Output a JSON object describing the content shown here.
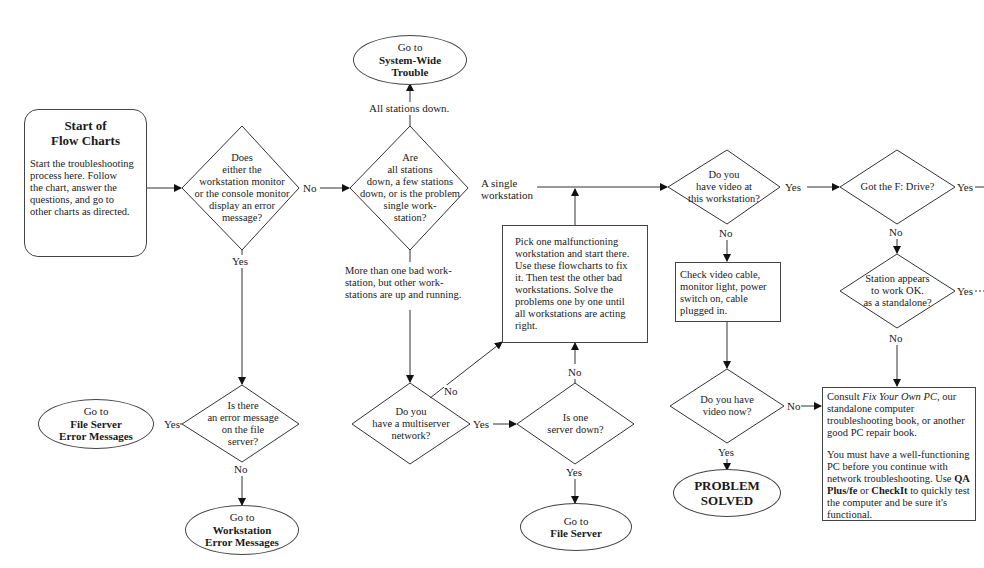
{
  "start": {
    "title_line1": "Start of",
    "title_line2": "Flow Charts",
    "body": [
      "Start the troubleshooting",
      "process here.  Follow",
      "the chart, answer the",
      "questions, and go to",
      "other charts as directed."
    ]
  },
  "decisions": {
    "error_message": [
      "Does",
      "either the",
      "workstation monitor",
      "or the console monitor",
      "display an error",
      "message?"
    ],
    "scope": [
      "Are",
      "all stations",
      "down, a few stations",
      "down, or is the problem",
      "single work-",
      "station?"
    ],
    "file_server_error": [
      "Is there",
      "an error message",
      "on the file",
      "server?"
    ],
    "multiserver": [
      "Do you",
      "have a multiserver",
      "network?"
    ],
    "server_down": [
      "Is one",
      "server down?"
    ],
    "video_here": [
      "Do you",
      "have video at",
      "this workstation?"
    ],
    "video_now": [
      "Do you have",
      "video now?"
    ],
    "f_drive": [
      "Got the F: Drive?"
    ],
    "standalone": [
      "Station appears",
      "to work OK.",
      "as a standalone?"
    ]
  },
  "terminals": {
    "system_wide": {
      "line1": "Go to",
      "line2": "System-Wide",
      "line3": "Trouble"
    },
    "file_server_errors": {
      "line1": "Go to",
      "line2": "File Server",
      "line3": "Error Messages"
    },
    "workstation_errors": {
      "line1": "Go to",
      "line2": "Workstation",
      "line3": "Error Messages"
    },
    "file_server": {
      "line1": "Go to",
      "line2": "File Server"
    },
    "problem_solved": {
      "line1": "PROBLEM",
      "line2": "SOLVED"
    }
  },
  "boxes": {
    "pick_one": [
      "Pick one malfunctioning",
      "workstation and start there.",
      "Use these flowcharts to fix",
      "it.  Then test the other bad",
      "workstations.  Solve the",
      "problems one by one until",
      "all workstations are acting",
      "right."
    ],
    "check_video": [
      "Check video cable,",
      "monitor light, power",
      "switch on, cable",
      "plugged in."
    ],
    "consult": {
      "p1_pre": "Consult ",
      "p1_italic": "Fix Your Own PC",
      "p1_post": ", our standalone computer troubleshooting book, or another good PC repair book.",
      "p2_pre": "You must have a well-functioning PC before you continue with network troubleshooting.  Use ",
      "p2_bold1": "QA Plus/fe",
      "p2_mid": " or ",
      "p2_bold2": "CheckIt",
      "p2_post": " to quickly test the computer and be sure it's functional."
    }
  },
  "labels": {
    "no_1": "No",
    "yes_1": "Yes",
    "all_down": "All stations down.",
    "single_ws_1": "A single",
    "single_ws_2": "workstation",
    "more_than_one": [
      "More than one bad work-",
      "station, but other work-",
      "stations are up and running."
    ],
    "yes_fs": "Yes",
    "no_fs": "No",
    "no_multi": "No",
    "yes_multi": "Yes",
    "no_server": "No",
    "yes_server": "Yes",
    "yes_video": "Yes",
    "no_video": "No",
    "no_video_now": "No",
    "yes_video_now": "Yes",
    "yes_fdrive": "Yes",
    "no_fdrive": "No",
    "yes_standalone": "Yes",
    "no_standalone": "No"
  }
}
